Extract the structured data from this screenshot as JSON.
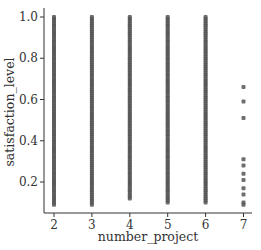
{
  "chart_data": {
    "type": "scatter",
    "title": "",
    "xlabel": "number_project",
    "ylabel": "satisfaction_level",
    "x_ticks": [
      2,
      3,
      4,
      5,
      6,
      7
    ],
    "y_ticks": [
      0.2,
      0.4,
      0.6,
      0.8,
      1.0
    ],
    "y_tick_labels": [
      "0.2",
      "0.4",
      "0.6",
      "0.8",
      "1.0"
    ],
    "xlim": [
      1.75,
      7.3
    ],
    "ylim": [
      0.06,
      1.05
    ],
    "grid": false,
    "legend": null,
    "point_color": "#555555",
    "series": [
      {
        "name": "2",
        "x": 2,
        "y_range": [
          0.09,
          1.0
        ],
        "distribution": "dense column"
      },
      {
        "name": "3",
        "x": 3,
        "y_range": [
          0.09,
          1.0
        ],
        "distribution": "dense column"
      },
      {
        "name": "4",
        "x": 4,
        "y_range": [
          0.12,
          1.0
        ],
        "distribution": "dense column"
      },
      {
        "name": "5",
        "x": 5,
        "y_range": [
          0.1,
          1.0
        ],
        "distribution": "dense column"
      },
      {
        "name": "6",
        "x": 6,
        "y_range": [
          0.1,
          1.0
        ],
        "distribution": "dense column"
      },
      {
        "name": "7",
        "x": 7,
        "y_values": [
          0.66,
          0.59,
          0.51,
          0.31,
          0.28,
          0.24,
          0.21,
          0.17,
          0.14,
          0.1,
          0.09
        ],
        "distribution": "sparse"
      }
    ]
  }
}
